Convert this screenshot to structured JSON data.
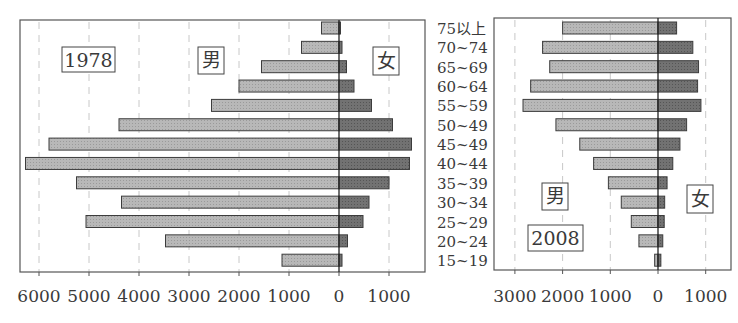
{
  "chart_data": [
    {
      "type": "bar",
      "orientation": "horizontal",
      "subtype": "population-pyramid",
      "title": "1978",
      "categories": [
        "75以上",
        "70~74",
        "65~69",
        "60~64",
        "55~59",
        "50~49",
        "45~49",
        "40~44",
        "35~39",
        "30~34",
        "25~29",
        "20~24",
        "15~19"
      ],
      "series": [
        {
          "name": "男",
          "side": "left",
          "color": "#b4b4b4",
          "values": [
            350,
            750,
            1550,
            2000,
            2550,
            4400,
            5800,
            6270,
            5250,
            4350,
            5060,
            3470,
            1140
          ]
        },
        {
          "name": "女",
          "side": "right",
          "color": "#6e6e6e",
          "values": [
            30,
            60,
            150,
            300,
            650,
            1070,
            1450,
            1410,
            1000,
            600,
            480,
            170,
            60
          ]
        }
      ],
      "xticks": [
        "6000",
        "5000",
        "4000",
        "3000",
        "2000",
        "1000",
        "0",
        "1000"
      ],
      "xtick_values": [
        -6000,
        -5000,
        -4000,
        -3000,
        -2000,
        -1000,
        0,
        1000
      ],
      "xlim": [
        -6700,
        1700
      ],
      "grid": "vertical dashed",
      "annotations": [
        "1978",
        "男",
        "女"
      ]
    },
    {
      "type": "bar",
      "orientation": "horizontal",
      "subtype": "population-pyramid",
      "title": "2008",
      "categories": [
        "75以上",
        "70~74",
        "65~69",
        "60~64",
        "55~59",
        "50~49",
        "45~49",
        "40~44",
        "35~39",
        "30~34",
        "25~29",
        "20~24",
        "15~19"
      ],
      "series": [
        {
          "name": "男",
          "side": "left",
          "color": "#b4b4b4",
          "values": [
            2000,
            2420,
            2270,
            2670,
            2830,
            2140,
            1640,
            1350,
            1040,
            770,
            560,
            400,
            70
          ]
        },
        {
          "name": "女",
          "side": "right",
          "color": "#6e6e6e",
          "values": [
            390,
            730,
            850,
            830,
            900,
            600,
            460,
            310,
            190,
            140,
            130,
            100,
            60
          ]
        }
      ],
      "xticks": [
        "3000",
        "2000",
        "1000",
        "0",
        "1000"
      ],
      "xtick_values": [
        -3000,
        -2000,
        -1000,
        0,
        1000
      ],
      "xlim": [
        -3400,
        1550
      ],
      "grid": "vertical dashed",
      "annotations": [
        "男",
        "2008",
        "女"
      ]
    }
  ],
  "labels": {
    "left_year": "1978",
    "left_male": "男",
    "left_female": "女",
    "right_year": "2008",
    "right_male": "男",
    "right_female": "女"
  },
  "age_groups": [
    "75以上",
    "70~74",
    "65~69",
    "60~64",
    "55~59",
    "50~49",
    "45~49",
    "40~44",
    "35~39",
    "30~34",
    "25~29",
    "20~24",
    "15~19"
  ]
}
